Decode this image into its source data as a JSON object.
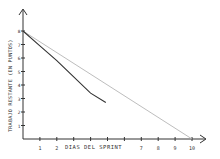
{
  "chart_data": {
    "type": "line",
    "title": "",
    "xlabel": "DIAS DEL SPRINT",
    "ylabel": "TRABAJO RESTANTE (EN PUNTOS)",
    "x_ticks": [
      "1",
      "2",
      "3",
      "4",
      "5",
      "6",
      "7",
      "8",
      "9",
      "10"
    ],
    "x_tick_labels_visible": [
      "1",
      "2",
      "7",
      "8",
      "9",
      "10"
    ],
    "y_ticks": [
      "1",
      "2",
      "3",
      "4",
      "5",
      "6",
      "7",
      "8"
    ],
    "xlim": [
      0,
      10
    ],
    "ylim": [
      0,
      8
    ],
    "grid": false,
    "legend": null,
    "series": [
      {
        "name": "Ideal",
        "color": "#b5b5b5",
        "x": [
          0,
          10
        ],
        "values": [
          8,
          0
        ]
      },
      {
        "name": "Real",
        "color": "#333333",
        "x": [
          0,
          1,
          2,
          3,
          4,
          4.9
        ],
        "values": [
          8,
          6.9,
          5.8,
          4.6,
          3.4,
          2.7
        ]
      }
    ]
  },
  "colors": {
    "axis": "#333333",
    "ideal": "#b5b5b5",
    "actual": "#333333",
    "background": "#ffffff"
  }
}
